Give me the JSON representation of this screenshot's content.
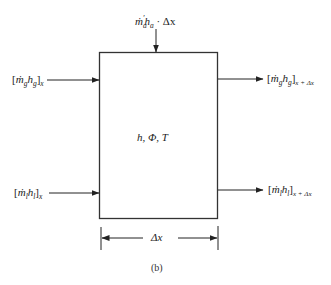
{
  "diagram": {
    "box": {
      "label": "h, Φ, T"
    },
    "inputs": {
      "top": {
        "m": "ṁ",
        "sub_m": "a",
        "prime": "′",
        "h": "h",
        "sub_h": "a",
        "suffix": " · Δx"
      },
      "gas_in": {
        "open": "[",
        "m": "ṁ",
        "sub_m": "g",
        "h": "h",
        "sub_h": "g",
        "close": "]",
        "sub": "x"
      },
      "liquid_in": {
        "open": "[",
        "m": "ṁ",
        "sub_m": "l",
        "h": "h",
        "sub_h": "l",
        "close": "]",
        "sub": "x"
      }
    },
    "outputs": {
      "gas_out": {
        "open": "[",
        "m": "ṁ",
        "sub_m": "g",
        "h": "h",
        "sub_h": "g",
        "close": "]",
        "sub": "x + Δx"
      },
      "liquid_out": {
        "open": "[",
        "m": "ṁ",
        "sub_m": "l",
        "h": "h",
        "sub_h": "l",
        "close": "]",
        "sub": "x + Δx"
      }
    },
    "dimension": {
      "label": "Δx"
    },
    "caption": "(b)"
  }
}
